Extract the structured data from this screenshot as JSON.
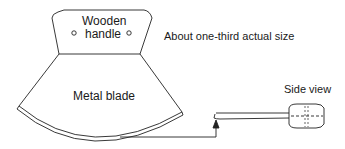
{
  "diagram": {
    "handle": {
      "line1": "Wooden",
      "line2": "handle"
    },
    "blade_label": "Metal blade",
    "scale_note": "About one-third actual size",
    "side_view_label": "Side view"
  },
  "colors": {
    "stroke": "#222222",
    "background": "#ffffff"
  }
}
